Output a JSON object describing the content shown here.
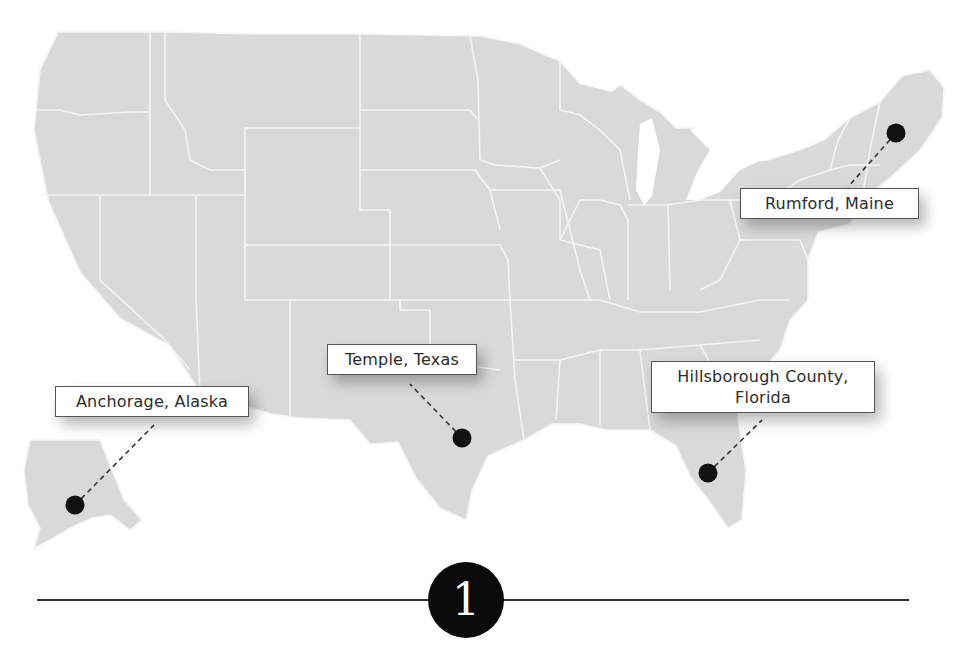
{
  "colors": {
    "land": "#d9d9d9",
    "borders": "#f4f4f4",
    "marker": "#111111",
    "leader_line": "#333333",
    "label_border": "#555555",
    "label_text": "#2b2b2b",
    "divider": "#333333",
    "badge_bg": "#0a0a0a",
    "badge_text": "#ffffff"
  },
  "map": {
    "region": "United States (contiguous + Alaska)",
    "locations": [
      {
        "id": "rumford",
        "label": "Rumford, Maine",
        "marker": [
          896,
          133
        ]
      },
      {
        "id": "temple",
        "label": "Temple, Texas",
        "marker": [
          462,
          438
        ]
      },
      {
        "id": "hillsborough",
        "label": "Hillsborough County, Florida",
        "label_line1": "Hillsborough County,",
        "label_line2": "Florida",
        "marker": [
          708,
          473
        ]
      },
      {
        "id": "anchorage",
        "label": "Anchorage, Alaska",
        "marker": [
          75,
          505
        ]
      }
    ]
  },
  "section": {
    "number": "1"
  }
}
